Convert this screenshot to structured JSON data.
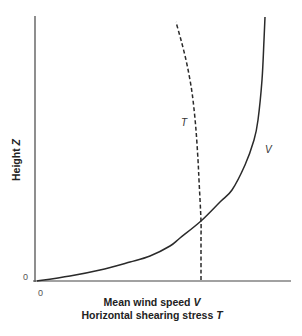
{
  "chart_data": {
    "type": "line",
    "title": "",
    "xlabel_line1": "Mean wind speed",
    "xlabel_line1_var": "V",
    "xlabel_line2": "Horizontal shearing stress",
    "xlabel_line2_var": "T",
    "ylabel": "Height",
    "ylabel_var": "Z",
    "x_origin_label": "0",
    "y_origin_label": "0",
    "grid": false,
    "legend": "none (inline curve labels)",
    "series": [
      {
        "name": "V",
        "description": "Mean wind speed profile (solid curve), increasing logarithmically with height",
        "style": "solid",
        "label": "V",
        "points_px": [
          [
            37,
            281
          ],
          [
            70,
            276
          ],
          [
            100,
            270
          ],
          [
            130,
            262
          ],
          [
            150,
            256
          ],
          [
            170,
            246
          ],
          [
            180,
            238
          ],
          [
            201,
            221
          ],
          [
            220,
            202
          ],
          [
            232,
            190
          ],
          [
            245,
            165
          ],
          [
            254,
            140
          ],
          [
            258,
            120
          ],
          [
            262,
            80
          ],
          [
            264,
            40
          ],
          [
            265,
            17
          ]
        ]
      },
      {
        "name": "T",
        "description": "Horizontal shearing stress (dashed curve), nearly constant near the surface then decreasing with height",
        "style": "dashed",
        "label": "T",
        "points_px": [
          [
            201,
            280
          ],
          [
            201,
            240
          ],
          [
            201,
            221
          ],
          [
            199,
            180
          ],
          [
            198,
            160
          ],
          [
            196,
            130
          ],
          [
            193,
            100
          ],
          [
            190,
            80
          ],
          [
            186,
            60
          ],
          [
            181,
            40
          ],
          [
            176,
            22
          ]
        ]
      }
    ],
    "annotations": [
      {
        "text": "T",
        "x_px": 184,
        "y_px": 125
      },
      {
        "text": "V",
        "x_px": 268,
        "y_px": 152
      }
    ]
  }
}
